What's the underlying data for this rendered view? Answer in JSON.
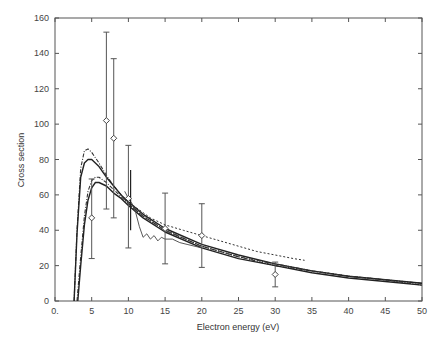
{
  "chart_data": {
    "type": "line",
    "title": "",
    "xlabel": "Electron energy (eV)",
    "ylabel": "Cross section",
    "xlim": [
      0,
      50
    ],
    "ylim": [
      0,
      160
    ],
    "grid": false,
    "legend": null,
    "x_ticks": [
      0,
      5,
      10,
      15,
      20,
      25,
      30,
      35,
      40,
      45,
      50
    ],
    "x_tick_labels": [
      "0.",
      "5",
      "10",
      "15",
      "20",
      "25",
      "30",
      "35",
      "40",
      "45",
      "50"
    ],
    "y_ticks": [
      0,
      20,
      40,
      60,
      80,
      100,
      120,
      140,
      160
    ],
    "y_tick_labels": [
      "0",
      "20",
      "40",
      "60",
      "80",
      "100",
      "120",
      "140",
      "160"
    ],
    "series": [
      {
        "name": "curve-1-upper-dashdot",
        "style": "dash-dot",
        "x": [
          2.6,
          3.0,
          3.5,
          4.0,
          4.5,
          5.0,
          6.0,
          7.0,
          8.0,
          9.0,
          10.0,
          12.0,
          15.0,
          20.0,
          25.0,
          30.0,
          35.0,
          40.0,
          45.0,
          50.0
        ],
        "y": [
          0,
          40,
          75,
          85,
          86,
          84,
          78,
          71,
          65,
          60,
          55,
          48,
          40,
          31,
          25,
          20,
          17,
          14,
          12,
          10
        ]
      },
      {
        "name": "curve-2-upper-solid",
        "style": "solid",
        "x": [
          2.6,
          3.0,
          3.5,
          4.0,
          4.5,
          5.0,
          6.0,
          7.0,
          8.0,
          9.0,
          10.0,
          12.0,
          15.0,
          20.0,
          25.0,
          30.0,
          35.0,
          40.0,
          45.0,
          50.0
        ],
        "y": [
          0,
          38,
          70,
          78,
          80,
          80,
          76,
          70,
          65,
          60,
          56,
          49,
          41,
          32,
          26,
          21,
          17,
          14,
          12,
          10
        ]
      },
      {
        "name": "curve-3-lower-dashdot",
        "style": "dash-dot",
        "x": [
          3.0,
          3.5,
          4.0,
          4.5,
          5.0,
          5.5,
          6.0,
          7.0,
          8.0,
          9.0,
          10.0,
          12.0,
          15.0,
          20.0,
          25.0,
          30.0,
          35.0,
          40.0,
          45.0,
          50.0
        ],
        "y": [
          0,
          25,
          48,
          62,
          68,
          70,
          70,
          67,
          63,
          59,
          55,
          48,
          40,
          31,
          25,
          21,
          17,
          14,
          12,
          9
        ]
      },
      {
        "name": "curve-4-lower-solid",
        "style": "solid",
        "x": [
          3.1,
          3.5,
          4.0,
          4.5,
          5.0,
          5.5,
          6.0,
          7.0,
          8.0,
          9.0,
          10.0,
          12.0,
          15.0,
          20.0,
          25.0,
          30.0,
          35.0,
          40.0,
          45.0,
          50.0
        ],
        "y": [
          0,
          20,
          43,
          57,
          64,
          67,
          67,
          65,
          61,
          58,
          54,
          47,
          39,
          30,
          24,
          20,
          16,
          13,
          11,
          9
        ]
      },
      {
        "name": "curve-5-dashed",
        "style": "dashed",
        "x": [
          9.0,
          10.0,
          11.0,
          12.0,
          13.0,
          15.0,
          17.5,
          20.0,
          22.5,
          25.0,
          27.5,
          30.0,
          32.5,
          34.0
        ],
        "y": [
          60,
          56,
          53,
          50,
          47,
          43,
          40,
          37,
          34,
          31,
          28,
          26,
          24,
          23
        ]
      },
      {
        "name": "curve-6-wiggly",
        "style": "solid-thin",
        "x": [
          9.5,
          10.0,
          10.5,
          11.0,
          11.5,
          12.0,
          12.5,
          13.0,
          13.5,
          14.0,
          14.5,
          15.0,
          16.0,
          17.0,
          18.0,
          20.0
        ],
        "y": [
          62,
          58,
          55,
          50,
          42,
          36,
          38,
          35,
          37,
          34,
          36,
          35,
          35,
          33,
          32,
          30
        ]
      }
    ],
    "data_points": {
      "name": "experimental",
      "marker": "open-diamond",
      "x": [
        5,
        7,
        8,
        10,
        15,
        20,
        30
      ],
      "y": [
        47,
        102,
        92,
        58,
        41,
        37,
        15
      ],
      "y_err_low": [
        24,
        52,
        47,
        30,
        21,
        19,
        8
      ],
      "y_err_high": [
        69,
        152,
        137,
        88,
        61,
        55,
        22
      ]
    },
    "annotations": [
      {
        "x": 10.3,
        "y_low": 40,
        "y_high": 74,
        "note": "sharp vertical spike near 10 eV"
      }
    ]
  }
}
